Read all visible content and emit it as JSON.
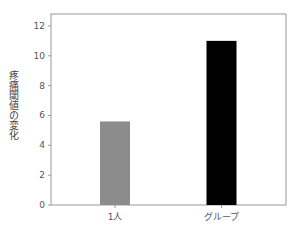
{
  "chart_data": {
    "type": "bar",
    "title": "",
    "xlabel": "",
    "ylabel": "疼痛閾値の変化",
    "categories": [
      "1人",
      "グループ"
    ],
    "values": [
      5.6,
      11.0
    ],
    "colors": [
      "#8c8c8c",
      "#000000"
    ],
    "ylim": [
      0,
      12.8
    ],
    "yticks": [
      0,
      2,
      4,
      6,
      8,
      10,
      12
    ],
    "grid": false,
    "legend": null
  }
}
